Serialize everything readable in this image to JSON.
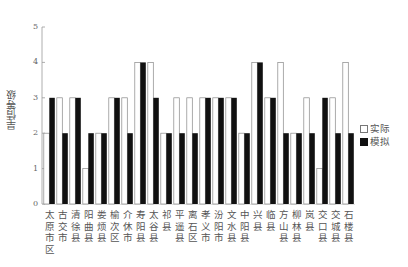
{
  "chart_data": {
    "type": "bar",
    "title": "",
    "xlabel": "",
    "ylabel": "旱情等级",
    "ylim": [
      0,
      5
    ],
    "yticks": [
      0,
      1,
      2,
      3,
      4,
      5
    ],
    "grid": false,
    "legend_position": "right",
    "categories": [
      "太原市区",
      "古交市",
      "清徐县",
      "阳曲县",
      "娄烦县",
      "榆次区",
      "介休市",
      "寿阳县",
      "太谷县",
      "祁县",
      "平遥县",
      "离石区",
      "孝义市",
      "汾阳市",
      "文水县",
      "中阳县",
      "兴县",
      "临县",
      "方山县",
      "柳林县",
      "岚县",
      "交口县",
      "交城县",
      "石楼县"
    ],
    "series": [
      {
        "name": "实际",
        "color": "#ffffff",
        "values": [
          2,
          3,
          3,
          1,
          2,
          3,
          3,
          4,
          4,
          2,
          3,
          3,
          3,
          3,
          3,
          2,
          4,
          3,
          4,
          2,
          3,
          1,
          3,
          4
        ]
      },
      {
        "name": "模拟",
        "color": "#111111",
        "values": [
          3,
          2,
          3,
          2,
          2,
          3,
          2,
          4,
          3,
          2,
          2,
          2,
          3,
          3,
          3,
          2,
          4,
          3,
          2,
          2,
          2,
          3,
          2,
          2
        ]
      }
    ]
  },
  "legend": {
    "actual": "实际",
    "simulated": "模拟"
  },
  "axis": {
    "ylabel": "旱情等级"
  }
}
